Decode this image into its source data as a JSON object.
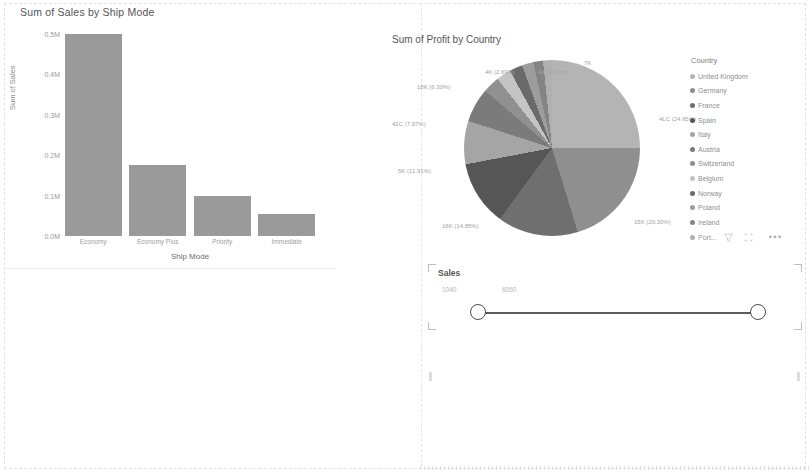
{
  "report": {
    "background": "#ffffff",
    "series_color": "#9a9a9a"
  },
  "bar_visual": {
    "title": "Sum of Sales by Ship Mode",
    "y_axis_title": "Sum of Sales",
    "x_axis_title": "Ship Mode"
  },
  "pie_visual": {
    "title": "Sum of Profit by Country",
    "legend_title": "Country",
    "legend_items": [
      {
        "label": "United Kingdom",
        "color": "#b4b4b4"
      },
      {
        "label": "Germany",
        "color": "#8f8f8f"
      },
      {
        "label": "France",
        "color": "#6f6f6f"
      },
      {
        "label": "Spain",
        "color": "#565656"
      },
      {
        "label": "Italy",
        "color": "#a5a5a5"
      },
      {
        "label": "Austria",
        "color": "#7b7b7b"
      },
      {
        "label": "Switzerland",
        "color": "#909090"
      },
      {
        "label": "Belgium",
        "color": "#c4c4c4"
      },
      {
        "label": "Norway",
        "color": "#6a6a6a"
      },
      {
        "label": "Poland",
        "color": "#9d9d9d"
      },
      {
        "label": "Ireland",
        "color": "#848484"
      },
      {
        "label": "Port...",
        "color": "#b0b0b0"
      }
    ],
    "legend_icons": [
      "filter-icon",
      "focus-mode-icon",
      "more-options-icon"
    ]
  },
  "slicer": {
    "title": "Sales",
    "min_value": "1040",
    "max_value": "6060"
  },
  "chart_data": [
    {
      "type": "bar",
      "title": "Sum of Sales by Ship Mode",
      "xlabel": "Ship Mode",
      "ylabel": "Sum of Sales",
      "categories": [
        "Economy",
        "Economy Plus",
        "Priority",
        "Immediate"
      ],
      "values": [
        0.5,
        0.175,
        0.1,
        0.055
      ],
      "value_unit": "M",
      "ylim": [
        0.0,
        0.5
      ],
      "ytick_labels": [
        "0.5M",
        "0.4M",
        "0.3M",
        "0.2M",
        "0.1M",
        "0.0M"
      ],
      "ytick_values": [
        0.5,
        0.4,
        0.3,
        0.2,
        0.1,
        0.0
      ],
      "grid": false,
      "legend": "none",
      "bar_color": "#9a9a9a"
    },
    {
      "type": "pie",
      "title": "Sum of Profit by Country",
      "legend_position": "right",
      "legend_title": "Country",
      "labels": [
        "United Kingdom",
        "Germany",
        "France",
        "Spain",
        "Italy",
        "Austria",
        "Switzerland",
        "Belgium",
        "Norway",
        "Poland",
        "Ireland",
        "Port..."
      ],
      "values": [
        24.95,
        20.3,
        14.85,
        11.91,
        7.97,
        6.3,
        3.09,
        2.69,
        2.4,
        2.1,
        1.8,
        1.64
      ],
      "value_unit": "%",
      "colors": [
        "#b4b4b4",
        "#8f8f8f",
        "#6f6f6f",
        "#565656",
        "#a5a5a5",
        "#7b7b7b",
        "#909090",
        "#c4c4c4",
        "#6a6a6a",
        "#9d9d9d",
        "#848484",
        "#b0b0b0"
      ],
      "data_labels": [
        {
          "text": "4LC (24.95%)",
          "x": 0.88,
          "y": 0.33
        },
        {
          "text": "15K (20.30%)",
          "x": 0.8,
          "y": 0.92
        },
        {
          "text": "16K (14.85%)",
          "x": 0.18,
          "y": 0.94
        },
        {
          "text": "5K (11.91%)",
          "x": 0.04,
          "y": 0.63
        },
        {
          "text": "42C (7.97%)",
          "x": 0.02,
          "y": 0.36
        },
        {
          "text": "18K (6.30%)",
          "x": 0.1,
          "y": 0.15
        },
        {
          "text": "4K (2.69%)",
          "x": 0.32,
          "y": 0.06
        },
        {
          "text": "4K (3.09%)",
          "x": 0.49,
          "y": 0.06
        },
        {
          "text": "7K",
          "x": 0.64,
          "y": 0.01
        }
      ]
    }
  ]
}
